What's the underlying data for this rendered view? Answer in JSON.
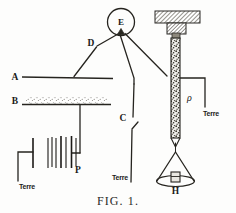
{
  "figure": {
    "caption_prefix": "F",
    "caption_rest": "IG. 1.",
    "caption_full": "FIG. 1."
  },
  "labels": {
    "plate_a": "A",
    "plate_b": "B",
    "switch_c": "C",
    "junction_d": "D",
    "spark_gap_e": "E",
    "capacitor_p": "P",
    "tube_rho": "ρ",
    "burner_h": "H",
    "ground_left": "Terre",
    "ground_middle": "Terre",
    "ground_right": "Terre"
  },
  "components": {
    "spark_gap": {
      "name": "spark-gap",
      "label": "E",
      "cx": 121,
      "cy": 22,
      "r": 13
    },
    "plate_a": {
      "name": "plate-a",
      "label": "A",
      "x1": 22,
      "y1": 76,
      "x2": 113,
      "y2": 78
    },
    "plate_b": {
      "name": "plate-b",
      "label": "B",
      "x1": 22,
      "y1": 104,
      "x2": 111,
      "y2": 104,
      "textured": true
    },
    "switch_c": {
      "name": "switch-c",
      "label": "C",
      "gap_top_y": 118,
      "gap_bottom_y": 128
    },
    "capacitor_p": {
      "name": "capacitor-stack-p",
      "label": "P",
      "plate_count": 7
    },
    "ground_symbol_left": {
      "name": "ground-electrode-left"
    },
    "tube": {
      "name": "vertical-tube",
      "label": "ρ",
      "x": 175,
      "top_y": 36,
      "bottom_y": 140
    },
    "clamp_block": {
      "name": "support-clamp-block",
      "hatched": true
    },
    "burner": {
      "name": "bunsen-burner-flame",
      "label": "H"
    }
  },
  "colors": {
    "ink": "#26241f",
    "paper": "#fdfdfc",
    "hatch": "#6a665c",
    "tube_fill": "#4a463f"
  }
}
